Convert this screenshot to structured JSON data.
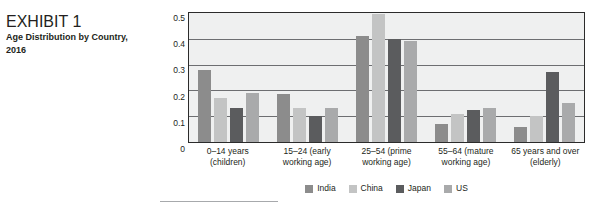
{
  "exhibit": {
    "number": "EXHIBIT 1",
    "title": "Age Distribution by Country, 2016"
  },
  "chart_data": {
    "type": "bar",
    "title": "",
    "subtitle": "",
    "xlabel": "",
    "ylabel": "",
    "ylim": [
      0,
      0.5
    ],
    "y_ticks": [
      "0.5",
      "0.4",
      "0.3",
      "0.2",
      "0.1",
      "0"
    ],
    "y_tick_values": [
      0.5,
      0.4,
      0.3,
      0.2,
      0.1,
      0
    ],
    "grid": true,
    "legend_position": "bottom",
    "categories": [
      "0–14 years (children)",
      "15–24 (early working age)",
      "25–54 (prime working age)",
      "55–64 (mature working age)",
      "65 years and over (elderly)"
    ],
    "category_lines": [
      [
        "0–14 years",
        "(children)"
      ],
      [
        "15–24 (early",
        "working age)"
      ],
      [
        "25–54 (prime",
        "working age)"
      ],
      [
        "55–64 (mature",
        "working age)"
      ],
      [
        "65 years and over",
        "(elderly)"
      ]
    ],
    "series": [
      {
        "name": "India",
        "color": "#8c8c8c",
        "values": [
          0.28,
          0.185,
          0.41,
          0.07,
          0.06
        ]
      },
      {
        "name": "China",
        "color": "#c3c4c4",
        "values": [
          0.17,
          0.13,
          0.495,
          0.11,
          0.1
        ]
      },
      {
        "name": "Japan",
        "color": "#5b5c5e",
        "values": [
          0.13,
          0.1,
          0.4,
          0.125,
          0.27
        ]
      },
      {
        "name": "US",
        "color": "#a9aaab",
        "values": [
          0.19,
          0.13,
          0.39,
          0.13,
          0.15
        ]
      }
    ]
  },
  "colors": {
    "plot_background": "#eff0f0",
    "plot_border": "#2b2b2b",
    "gridline": "#6d6e71",
    "text": "#231f20",
    "caption_number": "#58585b",
    "footnote_rule": "#a7a9ac"
  }
}
